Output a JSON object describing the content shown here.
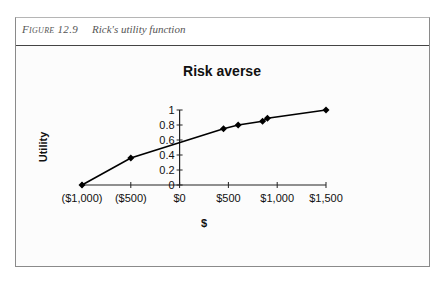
{
  "figure": {
    "number_label": "Figure 12.9",
    "caption": "Rick's utility function"
  },
  "chart_data": {
    "type": "line",
    "title": "Risk averse",
    "xlabel": "$",
    "ylabel": "Utility",
    "x_tick_labels": [
      "($1,000)",
      "($500)",
      "$0",
      "$500",
      "$1,000",
      "$1,500"
    ],
    "x_ticks": [
      -1000,
      -500,
      0,
      500,
      1000,
      1500
    ],
    "y_tick_labels": [
      "0",
      "0.2",
      "0.4",
      "0.6",
      "0.8",
      "1"
    ],
    "y_ticks": [
      0,
      0.2,
      0.4,
      0.6,
      0.8,
      1
    ],
    "xlim": [
      -1000,
      1500
    ],
    "ylim": [
      0,
      1
    ],
    "grid": false,
    "legend": "none",
    "marker": "diamond",
    "line_color": "#000000",
    "series": [
      {
        "name": "Utility",
        "x": [
          -1000,
          -500,
          450,
          600,
          850,
          900,
          1500
        ],
        "y": [
          0,
          0.36,
          0.75,
          0.8,
          0.85,
          0.89,
          1.0
        ]
      }
    ]
  }
}
